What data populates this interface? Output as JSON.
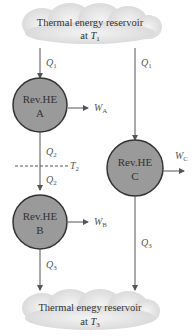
{
  "diagram": {
    "top_reservoir": {
      "line1": "Thermal energy reservoir",
      "line2_prefix": "at ",
      "temp_symbol": "T",
      "temp_sub": "1"
    },
    "bottom_reservoir": {
      "line1": "Thermal enegy reservoir",
      "line2_prefix": "at ",
      "temp_symbol": "T",
      "temp_sub": "3"
    },
    "engines": [
      {
        "id": "A",
        "line1": "Rev.HE",
        "line2": "A",
        "work_symbol": "W",
        "work_sub": "A"
      },
      {
        "id": "B",
        "line1": "Rev.HE",
        "line2": "B",
        "work_symbol": "W",
        "work_sub": "B"
      },
      {
        "id": "C",
        "line1": "Rev.HE",
        "line2": "C",
        "work_symbol": "W",
        "work_sub": "C"
      }
    ],
    "flows": {
      "q1_left": {
        "symbol": "Q",
        "sub": "1"
      },
      "q2_upper": {
        "symbol": "Q",
        "sub": "2"
      },
      "q2_lower": {
        "symbol": "Q",
        "sub": "2"
      },
      "q3_left": {
        "symbol": "Q",
        "sub": "3"
      },
      "q1_right": {
        "symbol": "Q",
        "sub": "1"
      },
      "q3_right": {
        "symbol": "Q",
        "sub": "3"
      }
    },
    "intermediate_temp": {
      "symbol": "T",
      "sub": "2"
    },
    "colors": {
      "engine_fill": "#9a9a9a",
      "engine_stroke": "#333333",
      "cloud_fill": "#e4e4e4",
      "line": "#555555"
    }
  }
}
